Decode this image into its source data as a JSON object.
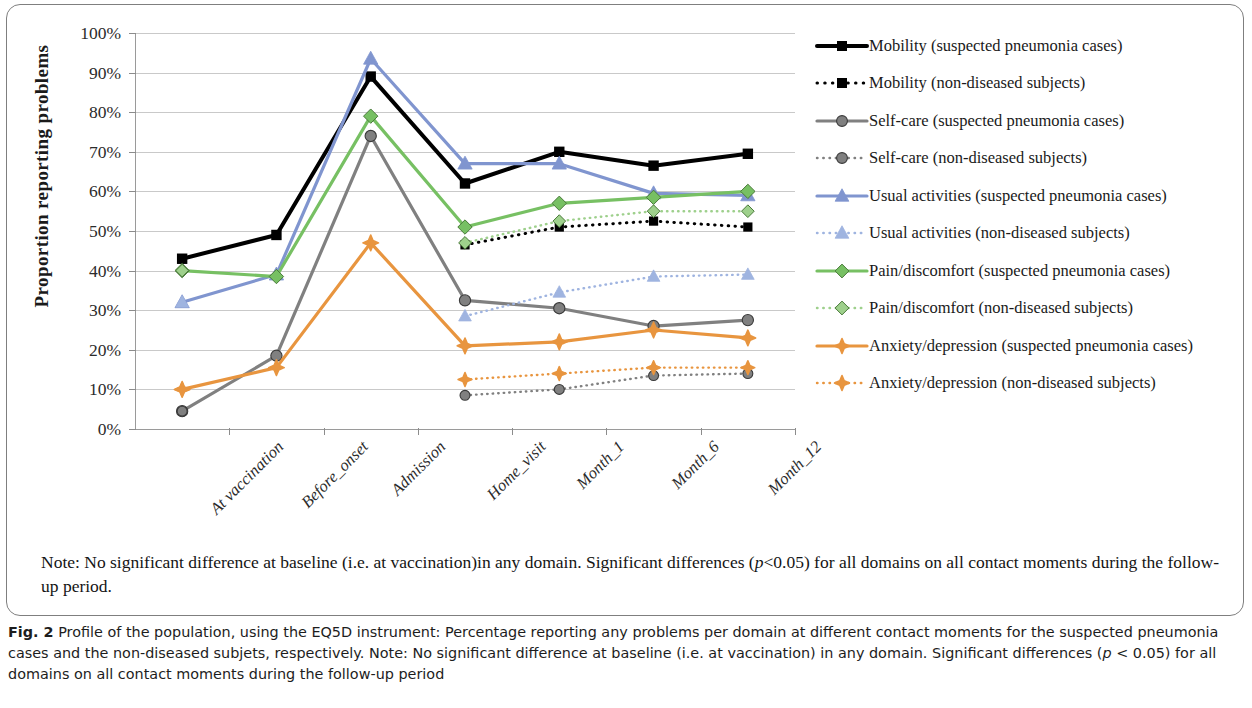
{
  "axis": {
    "y_title": "Proportion reporting problems",
    "y_ticks": [
      "100%",
      "90%",
      "80%",
      "70%",
      "60%",
      "50%",
      "40%",
      "30%",
      "20%",
      "10%",
      "0%"
    ]
  },
  "note": {
    "line1": "Note: No significant difference at baseline (i.e. at vaccination)in any domain. Significant differences (",
    "p_italic": "p",
    "line1b": "<0.05) for all domains on",
    "line2": "all contact moments during the follow-up period."
  },
  "caption": {
    "figure_label": "Fig. 2",
    "text_a": " Profile of the population, using the EQ5D instrument: Percentage reporting any problems per domain at different contact moments for the suspected pneumonia cases and the non-diseased subjets, respectively. Note: No significant difference at baseline (i.e. at vaccination) in any domain. Significant differences (",
    "p_italic": "p",
    "text_b": " < 0.05) for all domains on all contact moments during the follow-up period"
  },
  "chart_data": {
    "type": "line",
    "title": "",
    "xlabel": "",
    "ylabel": "Proportion reporting problems",
    "ylim": [
      0,
      100
    ],
    "grid": true,
    "legend_position": "right",
    "categories": [
      "At vaccination",
      "Before_onset",
      "Admission",
      "Home_visit",
      "Month_1",
      "Month_6",
      "Month_12"
    ],
    "series": [
      {
        "name": "Mobility (suspected pneumonia cases)",
        "color": "#000000",
        "linestyle": "solid",
        "linewidth": 4,
        "marker": "square",
        "values": [
          43,
          49,
          89,
          62,
          70,
          66.5,
          69.5
        ]
      },
      {
        "name": "Mobility (non-diseased subjects)",
        "color": "#000000",
        "linestyle": "dotted",
        "linewidth": 3,
        "marker": "square",
        "values": [
          43,
          null,
          null,
          46.5,
          51,
          52.5,
          51
        ]
      },
      {
        "name": "Self-care  (suspected pneumonia cases)",
        "color": "#808080",
        "linestyle": "solid",
        "linewidth": 3.2,
        "marker": "circle",
        "values": [
          4.5,
          18.5,
          74,
          32.5,
          30.5,
          26,
          27.5
        ]
      },
      {
        "name": "Self-care (non-diseased subjects)",
        "color": "#808080",
        "linestyle": "dotted",
        "linewidth": 2.4,
        "marker": "circle",
        "values": [
          4.5,
          null,
          null,
          8.5,
          10,
          13.5,
          14
        ]
      },
      {
        "name": "Usual activities  (suspected pneumonia cases)",
        "color": "#8095cf",
        "linestyle": "solid",
        "linewidth": 3.2,
        "marker": "triangle",
        "values": [
          32,
          39,
          93.5,
          67,
          67,
          59.5,
          59
        ]
      },
      {
        "name": "Usual activities (non-diseased subjects)",
        "color": "#9fb4e0",
        "linestyle": "dotted",
        "linewidth": 2.4,
        "marker": "triangle",
        "values": [
          32,
          null,
          null,
          28.5,
          34.5,
          38.5,
          39
        ]
      },
      {
        "name": "Pain/discomfort  (suspected pneumonia cases)",
        "color": "#77c063",
        "linestyle": "solid",
        "linewidth": 3.2,
        "marker": "diamond",
        "values": [
          40,
          38.5,
          79,
          51,
          57,
          58.5,
          60
        ]
      },
      {
        "name": "Pain/discomfort (non-diseased subjects)",
        "color": "#9ed08c",
        "linestyle": "dotted",
        "linewidth": 2.4,
        "marker": "diamond",
        "values": [
          40,
          null,
          null,
          47,
          52.5,
          55,
          55
        ]
      },
      {
        "name": "Anxiety/depression  (suspected pneumonia cases)",
        "color": "#e8953f",
        "linestyle": "solid",
        "linewidth": 3.2,
        "marker": "star",
        "values": [
          10,
          15.5,
          47,
          21,
          22,
          25,
          23
        ]
      },
      {
        "name": "Anxiety/depression (non-diseased subjects)",
        "color": "#e8953f",
        "linestyle": "dotted",
        "linewidth": 2.4,
        "marker": "star",
        "values": [
          10,
          null,
          null,
          12.5,
          14,
          15.5,
          15.5
        ]
      }
    ]
  }
}
